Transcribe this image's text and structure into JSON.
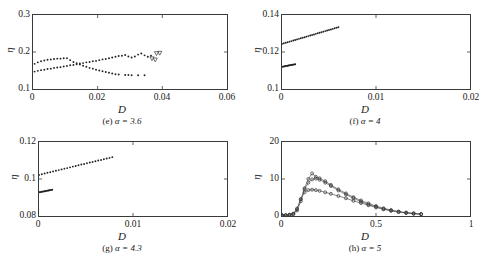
{
  "figure": {
    "axis_label_y": "η",
    "axis_label_x": "D"
  },
  "chart_data": [
    {
      "type": "scatter",
      "panel": "e",
      "caption_prefix": "(e)",
      "caption_alpha": "α = 3.6",
      "title": "",
      "xlabel": "D",
      "ylabel": "η",
      "xlim": [
        0,
        0.06
      ],
      "ylim": [
        0.1,
        0.3
      ],
      "xticks": [
        0,
        0.02,
        0.04,
        0.06
      ],
      "xticklabels": [
        "0",
        "0.02",
        "0.04",
        "0.06"
      ],
      "yticks": [
        0.1,
        0.2,
        0.3
      ],
      "yticklabels": [
        "0.1",
        "0.2",
        "0.3"
      ],
      "grid": false,
      "legend": "none",
      "series": [
        {
          "name": "upper-branch",
          "marker": "dot",
          "x": [
            0.0005,
            0.0015,
            0.0025,
            0.0035,
            0.0045,
            0.0055,
            0.0065,
            0.0075,
            0.0085,
            0.0095,
            0.0105,
            0.0115,
            0.0125,
            0.0135,
            0.0145,
            0.0155,
            0.0165,
            0.0175,
            0.0185,
            0.0195,
            0.0205,
            0.0215,
            0.0225,
            0.0235,
            0.0245,
            0.0255,
            0.0265
          ],
          "y": [
            0.168,
            0.172,
            0.175,
            0.177,
            0.179,
            0.18,
            0.181,
            0.182,
            0.182,
            0.183,
            0.183,
            0.178,
            0.173,
            0.17,
            0.166,
            0.163,
            0.16,
            0.157,
            0.155,
            0.152,
            0.15,
            0.148,
            0.146,
            0.144,
            0.142,
            0.14,
            0.139
          ]
        },
        {
          "name": "upper-branch-tail",
          "marker": "dot",
          "x": [
            0.0285,
            0.0295,
            0.0305,
            0.0325,
            0.0345
          ],
          "y": [
            0.138,
            0.138,
            0.137,
            0.137,
            0.137
          ]
        },
        {
          "name": "lower-branch",
          "marker": "dot",
          "x": [
            0.0005,
            0.0015,
            0.0025,
            0.0035,
            0.0045,
            0.0055,
            0.0065,
            0.0075,
            0.0085,
            0.0095,
            0.0105,
            0.0115,
            0.0125,
            0.0135,
            0.0145,
            0.0155,
            0.0165,
            0.0175,
            0.0185,
            0.0195,
            0.0205,
            0.0215,
            0.0225,
            0.0235,
            0.0245,
            0.0255,
            0.0265,
            0.0275,
            0.0285,
            0.0295,
            0.0305
          ],
          "y": [
            0.147,
            0.149,
            0.151,
            0.152,
            0.154,
            0.155,
            0.157,
            0.158,
            0.159,
            0.161,
            0.162,
            0.164,
            0.165,
            0.167,
            0.169,
            0.17,
            0.172,
            0.173,
            0.175,
            0.176,
            0.178,
            0.18,
            0.181,
            0.183,
            0.185,
            0.187,
            0.189,
            0.19,
            0.192,
            0.188,
            0.185
          ]
        },
        {
          "name": "lower-branch-osc",
          "marker": "dot",
          "x": [
            0.0315,
            0.0325,
            0.0335,
            0.0345,
            0.0355,
            0.0365
          ],
          "y": [
            0.188,
            0.193,
            0.196,
            0.191,
            0.187,
            0.19
          ]
        },
        {
          "name": "triangle-markers",
          "marker": "triangle-down",
          "x": [
            0.0368,
            0.0378,
            0.0382,
            0.0392
          ],
          "y": [
            0.182,
            0.179,
            0.196,
            0.197
          ]
        }
      ]
    },
    {
      "type": "scatter",
      "panel": "f",
      "caption_prefix": "(f)",
      "caption_alpha": "α = 4",
      "title": "",
      "xlabel": "D",
      "ylabel": "η",
      "xlim": [
        0,
        0.02
      ],
      "ylim": [
        0.1,
        0.14
      ],
      "xticks": [
        0,
        0.01,
        0.02
      ],
      "xticklabels": [
        "0",
        "0.01",
        "0.02"
      ],
      "yticks": [
        0.1,
        0.12,
        0.14
      ],
      "yticklabels": [
        "0.1",
        "0.12",
        "0.14"
      ],
      "grid": false,
      "legend": "none",
      "series": [
        {
          "name": "upper-branch",
          "marker": "dot",
          "x": [
            0.0,
            0.0002,
            0.0004,
            0.0006,
            0.0008,
            0.001,
            0.0012,
            0.0014,
            0.0016,
            0.0018,
            0.002,
            0.0022,
            0.0024,
            0.0026,
            0.0028,
            0.003,
            0.0032,
            0.0034,
            0.0036,
            0.0038,
            0.004,
            0.0042,
            0.0044,
            0.0046,
            0.0048,
            0.005,
            0.0052,
            0.0054,
            0.0056,
            0.0058,
            0.006
          ],
          "y": [
            0.1243,
            0.1247,
            0.125,
            0.1253,
            0.1256,
            0.1259,
            0.1262,
            0.1265,
            0.1268,
            0.1271,
            0.1274,
            0.1277,
            0.128,
            0.1283,
            0.1286,
            0.1289,
            0.1292,
            0.1295,
            0.1298,
            0.1301,
            0.1304,
            0.1307,
            0.131,
            0.1313,
            0.1316,
            0.1319,
            0.1322,
            0.1325,
            0.1328,
            0.1331,
            0.1334
          ]
        },
        {
          "name": "lower-cluster",
          "marker": "dot",
          "x": [
            0.0,
            0.0001,
            0.0002,
            0.0003,
            0.0004,
            0.0005,
            0.0006,
            0.0007,
            0.0008,
            0.0009,
            0.001,
            0.0011,
            0.0012,
            0.0013,
            0.0014
          ],
          "y": [
            0.112,
            0.1121,
            0.1122,
            0.1123,
            0.1124,
            0.1125,
            0.1126,
            0.1127,
            0.1128,
            0.1129,
            0.113,
            0.1131,
            0.1132,
            0.1133,
            0.1134
          ]
        }
      ]
    },
    {
      "type": "scatter",
      "panel": "g",
      "caption_prefix": "(g)",
      "caption_alpha": "α = 4.3",
      "title": "",
      "xlabel": "D",
      "ylabel": "η",
      "xlim": [
        0,
        0.02
      ],
      "ylim": [
        0.08,
        0.12
      ],
      "xticks": [
        0,
        0.01,
        0.02
      ],
      "xticklabels": [
        "0",
        "0.01",
        "0.02"
      ],
      "yticks": [
        0.08,
        0.1,
        0.12
      ],
      "yticklabels": [
        "0.08",
        "0.1",
        "0.12"
      ],
      "grid": false,
      "legend": "none",
      "series": [
        {
          "name": "upper-branch",
          "marker": "dot",
          "x": [
            0.0,
            0.0003,
            0.0006,
            0.0009,
            0.0012,
            0.0015,
            0.0018,
            0.0021,
            0.0024,
            0.0027,
            0.003,
            0.0033,
            0.0036,
            0.0039,
            0.0042,
            0.0045,
            0.0048,
            0.0051,
            0.0054,
            0.0057,
            0.006,
            0.0063,
            0.0066,
            0.0069,
            0.0072,
            0.0075,
            0.0078
          ],
          "y": [
            0.1022,
            0.1026,
            0.103,
            0.1034,
            0.1037,
            0.1041,
            0.1045,
            0.1048,
            0.1052,
            0.1056,
            0.1059,
            0.1063,
            0.1067,
            0.107,
            0.1074,
            0.1078,
            0.1081,
            0.1085,
            0.1089,
            0.1092,
            0.1096,
            0.11,
            0.1103,
            0.1107,
            0.1111,
            0.1114,
            0.1118
          ]
        },
        {
          "name": "lower-cluster",
          "marker": "dot",
          "x": [
            0.0,
            0.0001,
            0.0002,
            0.0003,
            0.0004,
            0.0005,
            0.0006,
            0.0007,
            0.0008,
            0.0009,
            0.001,
            0.0011,
            0.0012,
            0.0013,
            0.0014
          ],
          "y": [
            0.0928,
            0.0929,
            0.093,
            0.0931,
            0.0932,
            0.0933,
            0.0934,
            0.0935,
            0.0936,
            0.0937,
            0.0938,
            0.0939,
            0.094,
            0.0941,
            0.0942
          ]
        }
      ]
    },
    {
      "type": "line",
      "panel": "h",
      "caption_prefix": "(h)",
      "caption_alpha": "α = 5",
      "title": "",
      "xlabel": "D",
      "ylabel": "η",
      "xlim": [
        0,
        1
      ],
      "ylim": [
        0,
        20
      ],
      "xticks": [
        0,
        0.5,
        1
      ],
      "xticklabels": [
        "0",
        "0.5",
        "1"
      ],
      "yticks": [
        0,
        10,
        20
      ],
      "yticklabels": [
        "0",
        "10",
        "20"
      ],
      "grid": false,
      "legend": "none",
      "series": [
        {
          "name": "curve-peak-high",
          "marker": "circle",
          "x": [
            0.0,
            0.02,
            0.04,
            0.06,
            0.08,
            0.1,
            0.12,
            0.14,
            0.16,
            0.18,
            0.2,
            0.23,
            0.26,
            0.3,
            0.34,
            0.38,
            0.42,
            0.46,
            0.5,
            0.54,
            0.58,
            0.62,
            0.66,
            0.7,
            0.74
          ],
          "y": [
            0.2,
            0.2,
            0.3,
            0.5,
            1.5,
            4.0,
            7.5,
            10.0,
            11.5,
            10.6,
            10.2,
            9.4,
            8.4,
            7.2,
            6.1,
            5.1,
            4.2,
            3.4,
            2.7,
            2.1,
            1.6,
            1.2,
            0.9,
            0.7,
            0.5
          ]
        },
        {
          "name": "curve-peak-mid",
          "marker": "circle",
          "x": [
            0.0,
            0.02,
            0.04,
            0.06,
            0.08,
            0.1,
            0.12,
            0.14,
            0.16,
            0.18,
            0.2,
            0.23,
            0.26,
            0.3,
            0.34,
            0.38,
            0.42,
            0.46,
            0.5,
            0.54,
            0.58,
            0.62,
            0.66,
            0.7,
            0.74
          ],
          "y": [
            0.2,
            0.2,
            0.3,
            0.6,
            1.8,
            4.5,
            7.2,
            9.0,
            9.9,
            10.1,
            9.8,
            9.0,
            8.1,
            6.9,
            5.8,
            4.8,
            3.9,
            3.1,
            2.5,
            1.9,
            1.5,
            1.1,
            0.9,
            0.7,
            0.5
          ]
        },
        {
          "name": "curve-peak-low",
          "marker": "circle",
          "x": [
            0.0,
            0.02,
            0.04,
            0.06,
            0.08,
            0.1,
            0.12,
            0.14,
            0.16,
            0.18,
            0.2,
            0.23,
            0.26,
            0.3,
            0.34,
            0.38,
            0.42,
            0.46,
            0.5,
            0.54,
            0.58,
            0.62,
            0.66,
            0.7,
            0.74
          ],
          "y": [
            0.2,
            0.2,
            0.3,
            0.6,
            2.0,
            4.6,
            6.4,
            7.0,
            7.1,
            7.0,
            6.8,
            6.4,
            6.0,
            5.4,
            4.8,
            4.1,
            3.5,
            2.9,
            2.3,
            1.8,
            1.4,
            1.1,
            0.8,
            0.6,
            0.5
          ]
        }
      ]
    }
  ]
}
